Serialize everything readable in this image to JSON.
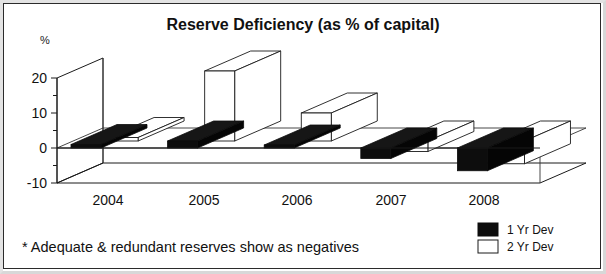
{
  "chart_data": {
    "type": "bar",
    "title": "Reserve Deficiency (as % of capital)",
    "xlabel": "",
    "ylabel": "%",
    "categories": [
      "2004",
      "2005",
      "2006",
      "2007",
      "2008"
    ],
    "series": [
      {
        "name": "1 Yr Dev",
        "color": "#0d0d0d",
        "values": [
          1,
          2,
          0,
          -3,
          -6.5
        ]
      },
      {
        "name": "2 Yr Dev",
        "color": "#ffffff",
        "values": [
          1,
          20,
          8,
          -3,
          -6.5
        ]
      }
    ],
    "ylim": [
      -10,
      25
    ],
    "yticks": [
      -10,
      -5,
      0,
      5,
      10,
      15,
      20
    ],
    "ytick_labels": [
      "-10",
      "",
      "0",
      "",
      "10",
      "",
      "20"
    ],
    "grid": false,
    "legend_position": "bottom-right",
    "three_d": true,
    "annotation": "* Adequate & redundant reserves show as negatives"
  },
  "chart": {
    "title": "Reserve Deficiency (as % of capital)",
    "y_axis_unit": "%",
    "footnote": "* Adequate & redundant reserves show as negatives",
    "legend": {
      "items": [
        {
          "label": "1 Yr Dev",
          "swatch": "black-square-icon"
        },
        {
          "label": "2 Yr Dev",
          "swatch": "white-square-icon"
        }
      ]
    }
  }
}
